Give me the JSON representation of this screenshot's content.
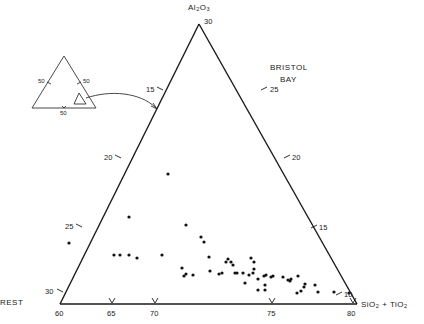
{
  "chart_data": {
    "type": "scatter",
    "subtype": "ternary",
    "title_line1": "BRISTOL",
    "title_line2": "BAY",
    "axes": {
      "top": {
        "label": "Al2O3",
        "apex_value": "30"
      },
      "left": {
        "label": "REST",
        "vertex_value": "60"
      },
      "right": {
        "label": "SiO2 + TiO2",
        "vertex_value": "80"
      }
    },
    "ticks": {
      "bottom": [
        {
          "label": "60",
          "x": 60
        },
        {
          "label": "65",
          "x": 112
        },
        {
          "label": "70",
          "x": 155
        },
        {
          "label": "75",
          "x": 272
        },
        {
          "label": "80",
          "x": 353
        }
      ],
      "left": [
        {
          "label": "15",
          "x": 160,
          "y": 89
        },
        {
          "label": "20",
          "x": 118,
          "y": 157
        },
        {
          "label": "25",
          "x": 79,
          "y": 226
        },
        {
          "label": "30",
          "x": 60,
          "y": 291
        }
      ],
      "right": [
        {
          "label": "25",
          "x": 264,
          "y": 89
        },
        {
          "label": "20",
          "x": 287,
          "y": 157
        },
        {
          "label": "15",
          "x": 314,
          "y": 227
        },
        {
          "label": "10",
          "x": 339,
          "y": 294
        }
      ]
    },
    "inset": {
      "description": "Full ternary diagram showing location of enlarged sub-triangle",
      "tick_labels": [
        "50",
        "50",
        "50"
      ]
    },
    "points_px": [
      [
        168,
        174
      ],
      [
        129,
        217
      ],
      [
        69,
        243
      ],
      [
        114,
        255
      ],
      [
        120,
        255
      ],
      [
        129,
        255
      ],
      [
        137,
        258
      ],
      [
        162,
        255
      ],
      [
        186,
        225
      ],
      [
        201,
        237
      ],
      [
        204,
        242
      ],
      [
        209,
        257
      ],
      [
        182,
        268
      ],
      [
        186,
        274
      ],
      [
        184,
        276
      ],
      [
        193,
        275
      ],
      [
        210,
        271
      ],
      [
        222,
        273
      ],
      [
        219,
        274
      ],
      [
        226,
        262
      ],
      [
        228,
        259
      ],
      [
        231,
        262
      ],
      [
        235,
        273
      ],
      [
        233,
        265
      ],
      [
        237,
        273
      ],
      [
        243,
        273
      ],
      [
        249,
        275
      ],
      [
        254,
        269
      ],
      [
        251,
        258
      ],
      [
        254,
        262
      ],
      [
        253,
        273
      ],
      [
        245,
        283
      ],
      [
        258,
        279
      ],
      [
        258,
        290
      ],
      [
        265,
        290
      ],
      [
        265,
        285
      ],
      [
        264,
        276
      ],
      [
        266,
        275
      ],
      [
        271,
        277
      ],
      [
        273,
        276
      ],
      [
        283,
        277
      ],
      [
        288,
        280
      ],
      [
        290,
        281
      ],
      [
        291,
        279
      ],
      [
        298,
        276
      ],
      [
        304,
        287
      ],
      [
        297,
        293
      ],
      [
        301,
        291
      ],
      [
        305,
        284
      ],
      [
        315,
        285
      ],
      [
        318,
        292
      ],
      [
        334,
        292
      ],
      [
        349,
        293
      ]
    ]
  },
  "labels": {
    "apex_label": "Al2O3",
    "apex_value": "30",
    "left_label": "REST",
    "right_label_main": "SiO",
    "right_label_tail": "+ TiO",
    "inset_tick": "50"
  }
}
